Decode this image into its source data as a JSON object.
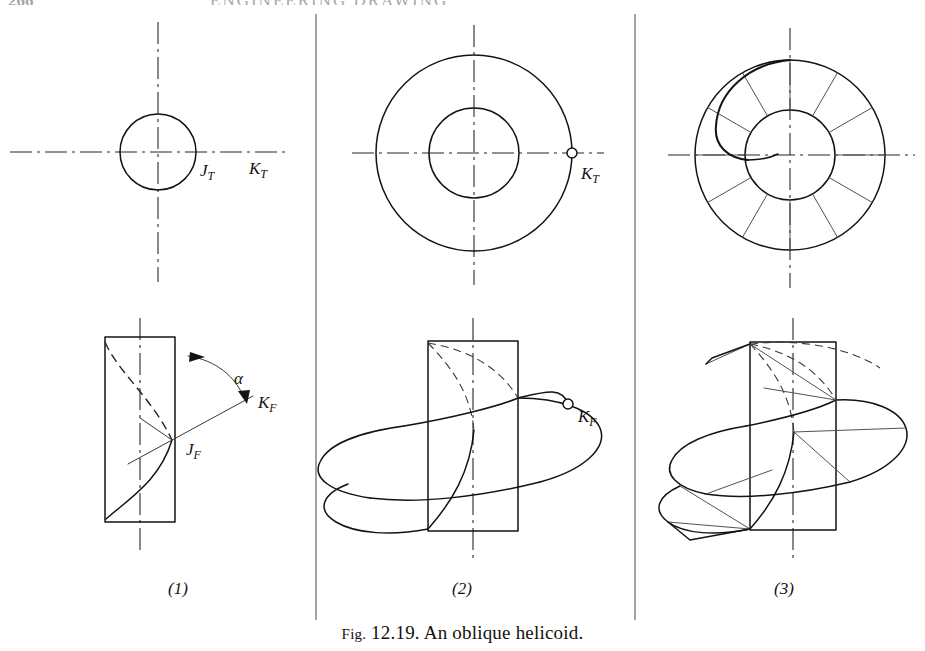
{
  "page": {
    "running_head_page_number": "266",
    "running_head_title": "ENGINEERING DRAWING",
    "caption_prefix": "Fig.",
    "caption_number": "12.19.",
    "caption_text": "An oblique helicoid.",
    "caption_full": "Fig. 12.19. An oblique helicoid."
  },
  "ink": {
    "line": "#16130f",
    "thin": "#3b3833",
    "center": "#2a2724",
    "hidden": "#26231f",
    "divider": "#5a5753",
    "paper": "#ffffff"
  },
  "panels": [
    {
      "number": "(1)",
      "number_x": 178,
      "number_y": 588,
      "top_view": {
        "name": "single-circle-top-view",
        "center_x": 158,
        "center_y": 152,
        "radius": 38,
        "labels": [
          {
            "text": "J",
            "sub": "T",
            "x": 200,
            "y": 172
          },
          {
            "text": "K",
            "sub": "T",
            "x": 249,
            "y": 170
          }
        ]
      },
      "front_view": {
        "name": "single-helix-front-view",
        "rect_x": 105,
        "rect_y": 337,
        "rect_w": 70,
        "rect_h": 185,
        "labels": [
          {
            "text": "α",
            "sub": "",
            "x": 234,
            "y": 380
          },
          {
            "text": "K",
            "sub": "F",
            "x": 258,
            "y": 404
          },
          {
            "text": "J",
            "sub": "F",
            "x": 186,
            "y": 451
          }
        ]
      }
    },
    {
      "number": "(2)",
      "number_x": 462,
      "number_y": 588,
      "top_view": {
        "name": "annulus-top-view",
        "center_x": 474,
        "center_y": 153,
        "outer_radius": 98,
        "inner_radius": 45,
        "marker": {
          "name": "point-k-top",
          "x": 572,
          "y": 153
        },
        "labels": [
          {
            "text": "K",
            "sub": "T",
            "x": 581,
            "y": 175
          }
        ]
      },
      "front_view": {
        "name": "double-helix-front-view",
        "rect_x": 428,
        "rect_y": 341,
        "rect_w": 90,
        "rect_h": 190,
        "marker": {
          "name": "point-k-front",
          "x": 568,
          "y": 404
        },
        "labels": [
          {
            "text": "K",
            "sub": "F",
            "x": 578,
            "y": 418
          }
        ]
      }
    },
    {
      "number": "(3)",
      "number_x": 784,
      "number_y": 588,
      "top_view": {
        "name": "helicoid-top-view",
        "center_x": 790,
        "center_y": 155,
        "outer_radius": 95,
        "inner_radius": 45,
        "element_count": 12,
        "labels": []
      },
      "front_view": {
        "name": "helicoid-front-view",
        "rect_x": 750,
        "rect_y": 342,
        "rect_w": 86,
        "rect_h": 188,
        "labels": []
      }
    }
  ],
  "dividers": [
    {
      "name": "panel-divider-1",
      "x": 316
    },
    {
      "name": "panel-divider-2",
      "x": 635
    }
  ]
}
